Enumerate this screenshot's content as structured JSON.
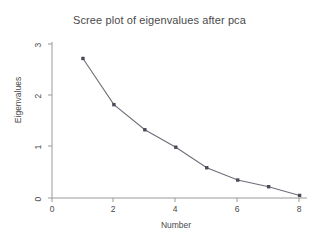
{
  "chart_data": {
    "type": "line",
    "title": "Scree plot of eigenvalues after pca",
    "xlabel": "Number",
    "ylabel": "Eigenvalues",
    "x": [
      1,
      2,
      3,
      4,
      5,
      6,
      7,
      8
    ],
    "values": [
      2.72,
      1.82,
      1.33,
      0.99,
      0.59,
      0.35,
      0.22,
      0.05
    ],
    "series": [
      {
        "name": "Eigenvalues",
        "values": [
          2.72,
          1.82,
          1.33,
          0.99,
          0.59,
          0.35,
          0.22,
          0.05
        ]
      }
    ],
    "xticks": [
      "0",
      "2",
      "4",
      "6",
      "8"
    ],
    "xtick_values": [
      0,
      2,
      4,
      6,
      8
    ],
    "yticks": [
      "0",
      "1",
      "2",
      "3"
    ],
    "ytick_values": [
      0,
      1,
      2,
      3
    ],
    "xlim": [
      0,
      8.2
    ],
    "ylim": [
      0,
      3.12
    ],
    "grid": false,
    "legend": false,
    "marker": "square",
    "line_color": "#6e6e78",
    "marker_color": "#4a4a58",
    "axis_color": "#9a9a9a",
    "background_color": "#ffffff"
  }
}
